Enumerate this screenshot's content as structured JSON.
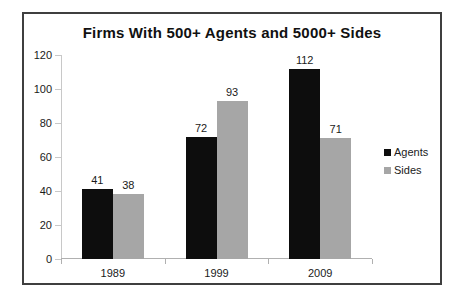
{
  "chart_data": {
    "type": "bar",
    "title": "Firms With 500+ Agents and 5000+ Sides",
    "xlabel": "",
    "ylabel": "",
    "categories": [
      "1989",
      "1999",
      "2009"
    ],
    "series": [
      {
        "name": "Agents",
        "color": "#0d0d0d",
        "values": [
          41,
          72,
          112
        ]
      },
      {
        "name": "Sides",
        "color": "#a6a6a6",
        "values": [
          38,
          93,
          71
        ]
      }
    ],
    "ylim": [
      0,
      120
    ],
    "yticks": [
      0,
      20,
      40,
      60,
      80,
      100,
      120
    ],
    "ytick_labels": [
      "0",
      "20",
      "40",
      "60",
      "80",
      "100",
      "120"
    ],
    "grid": false,
    "legend_position": "right",
    "data_labels": true,
    "data_label_values": {
      "agents": [
        "41",
        "72",
        "112"
      ],
      "sides": [
        "38",
        "93",
        "71"
      ]
    }
  },
  "legend": {
    "items": [
      {
        "label": "Agents",
        "color": "#0d0d0d"
      },
      {
        "label": "Sides",
        "color": "#a6a6a6"
      }
    ]
  },
  "frame": {
    "border_color": "#3f3f3f",
    "background": "#ffffff"
  }
}
